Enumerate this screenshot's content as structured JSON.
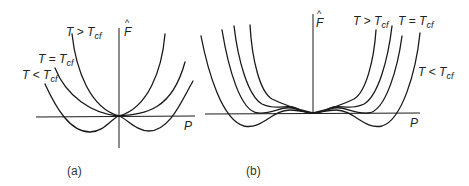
{
  "figure": {
    "panels": [
      {
        "id": "a",
        "caption": "(a)",
        "y_axis_label": "F",
        "x_axis_label": "P",
        "curves": [
          {
            "label_T": "T",
            "label_rel": ">",
            "label_Tc": "T",
            "label_sub": "cf"
          },
          {
            "label_T": "T",
            "label_rel": "=",
            "label_Tc": "T",
            "label_sub": "cf"
          },
          {
            "label_T": "T",
            "label_rel": "<",
            "label_Tc": "T",
            "label_sub": "cf"
          }
        ]
      },
      {
        "id": "b",
        "caption": "(b)",
        "y_axis_label": "F",
        "x_axis_label": "P",
        "curves": [
          {
            "label_T": "T",
            "label_rel": ">",
            "label_Tc": "T",
            "label_sub": "cf"
          },
          {
            "label_T": "T",
            "label_rel": "=",
            "label_Tc": "T",
            "label_sub": "cf"
          },
          {
            "label_T": "T",
            "label_rel": "<",
            "label_Tc": "T",
            "label_sub": "cf"
          }
        ]
      }
    ]
  }
}
